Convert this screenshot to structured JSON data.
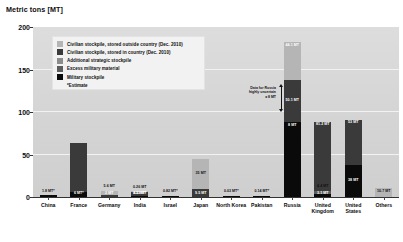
{
  "axis": {
    "y_title": "Metric tons [MT]",
    "y_ticks": [
      "0",
      "50",
      "100",
      "150",
      "200"
    ]
  },
  "legend": {
    "items": [
      {
        "label": "Civilian stockpile, stored outside country (Dec. 2010)",
        "color": "#b5b5b5"
      },
      {
        "label": "Civilian stockpile, stored in country (Dec. 2010)",
        "color": "#3a3a3a"
      },
      {
        "label": "Additional strategic stockpile",
        "color": "#8c8c8c"
      },
      {
        "label": "Excess military material",
        "color": "#5c5c5c"
      },
      {
        "label": "Military stockpile",
        "color": "#0a0a0a"
      }
    ],
    "note": "*Estimate"
  },
  "annotation": {
    "russia_uncertainty": "Data for Russia\nhighly uncertain\n± 8 MT"
  },
  "chart_data": {
    "type": "bar",
    "title": "",
    "xlabel": "",
    "ylabel": "Metric tons [MT]",
    "ylim": [
      0,
      200
    ],
    "grid": true,
    "stacked": true,
    "legend_position": "inside-upper-left",
    "categories": [
      "China",
      "France",
      "Germany",
      "India",
      "Israel",
      "Japan",
      "North Korea",
      "Pakistan",
      "Russia",
      "United Kingdom",
      "United States",
      "Others"
    ],
    "series": [
      {
        "name": "Military stockpile",
        "color": "#0a0a0a",
        "values": [
          1.8,
          6.0,
          0,
          0.52,
          0.82,
          0,
          0.03,
          0.14,
          88.0,
          3.1,
          38.0,
          0
        ]
      },
      {
        "name": "Excess military material",
        "color": "#5c5c5c",
        "values": [
          0,
          0,
          0,
          0,
          0,
          0,
          0,
          0,
          0,
          4.4,
          0,
          0
        ]
      },
      {
        "name": "Additional strategic stockpile",
        "color": "#8c8c8c",
        "values": [
          0,
          0,
          0,
          0,
          0,
          0,
          0,
          0,
          0,
          0,
          0,
          0
        ]
      },
      {
        "name": "Civilian stockpile, stored in country (Dec. 2010)",
        "color": "#3a3a3a",
        "values": [
          0,
          57.0,
          2.0,
          4.2,
          0,
          9.5,
          0,
          0,
          50.1,
          81.2,
          53.0,
          0
        ]
      },
      {
        "name": "Civilian stockpile, stored outside country (Dec. 2010)",
        "color": "#b5b5b5",
        "values": [
          0,
          0,
          5.6,
          0.26,
          0,
          35.0,
          0,
          0,
          44.1,
          0,
          0,
          10.7
        ]
      }
    ],
    "bar_labels": [
      {
        "category": "China",
        "labels": [
          "1.8 MT*"
        ]
      },
      {
        "category": "France",
        "labels": [
          "6 MT*"
        ]
      },
      {
        "category": "Germany",
        "labels": [
          "5.6 MT",
          "2 MT"
        ]
      },
      {
        "category": "India",
        "labels": [
          "0.26 MT",
          "4.2 MT*",
          "0.52 MT"
        ]
      },
      {
        "category": "Israel",
        "labels": [
          "0.82 MT*"
        ]
      },
      {
        "category": "Japan",
        "labels": [
          "35 MT",
          "9.5 MT"
        ]
      },
      {
        "category": "North Korea",
        "labels": [
          "0.03 MT*"
        ]
      },
      {
        "category": "Pakistan",
        "labels": [
          "0.14 MT*"
        ]
      },
      {
        "category": "Russia",
        "labels": [
          "44.1 MT",
          "50.1 MT",
          "8 MT",
          "88 MT*"
        ]
      },
      {
        "category": "United Kingdom",
        "labels": [
          "4.4 MT",
          "81.2 MT",
          "3.1 MT"
        ]
      },
      {
        "category": "United States",
        "labels": [
          "53 MT",
          "38 MT"
        ]
      },
      {
        "category": "Others",
        "labels": [
          "10.7 MT"
        ]
      }
    ]
  }
}
